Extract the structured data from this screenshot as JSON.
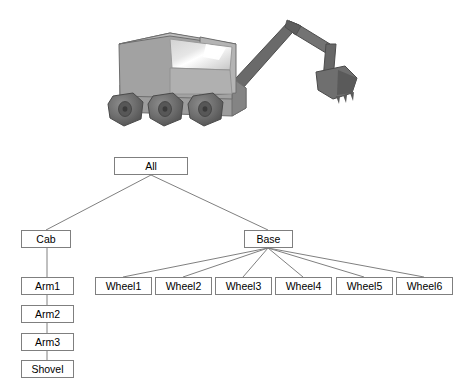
{
  "figure": {
    "caption_absent": true,
    "model": {
      "name": "excavator-3d-model",
      "description": "Shaded 3D rendering of a six-wheeled excavator with cab, windshield and articulated arm with shovel",
      "parts": [
        "cab-body",
        "windshield",
        "chassis",
        "wheel",
        "arm-segment-1",
        "arm-segment-2",
        "arm-segment-3",
        "shovel-bucket"
      ],
      "colors": {
        "body_light": "#b9b9b9",
        "body_mid": "#9a9a9a",
        "body_dark": "#7d7d7d",
        "glass_light": "#e8e8e8",
        "glass_highlight": "#ffffff",
        "arm_dark": "#6b6b6b",
        "arm_darker": "#585858",
        "wheel_dark": "#6e6e6e",
        "wheel_darker": "#555555",
        "outline": "#4a4a4a"
      }
    }
  },
  "scene_graph": {
    "type": "tree",
    "edge_color": "#808080",
    "node_border_color": "#7f7f7f",
    "node_fill_color": "#ffffff",
    "node_text_color": "#000000",
    "nodes": {
      "all": {
        "label": "All"
      },
      "cab": {
        "label": "Cab"
      },
      "base": {
        "label": "Base"
      },
      "arm1": {
        "label": "Arm1"
      },
      "arm2": {
        "label": "Arm2"
      },
      "arm3": {
        "label": "Arm3"
      },
      "shovel": {
        "label": "Shovel"
      },
      "wheels": [
        {
          "label": "Wheel1"
        },
        {
          "label": "Wheel2"
        },
        {
          "label": "Wheel3"
        },
        {
          "label": "Wheel4"
        },
        {
          "label": "Wheel5"
        },
        {
          "label": "Wheel6"
        }
      ]
    },
    "edges": [
      {
        "from": "All",
        "to": "Cab"
      },
      {
        "from": "All",
        "to": "Base"
      },
      {
        "from": "Cab",
        "to": "Arm1"
      },
      {
        "from": "Arm1",
        "to": "Arm2"
      },
      {
        "from": "Arm2",
        "to": "Arm3"
      },
      {
        "from": "Arm3",
        "to": "Shovel"
      },
      {
        "from": "Base",
        "to": "Wheel1"
      },
      {
        "from": "Base",
        "to": "Wheel2"
      },
      {
        "from": "Base",
        "to": "Wheel3"
      },
      {
        "from": "Base",
        "to": "Wheel4"
      },
      {
        "from": "Base",
        "to": "Wheel5"
      },
      {
        "from": "Base",
        "to": "Wheel6"
      }
    ]
  }
}
